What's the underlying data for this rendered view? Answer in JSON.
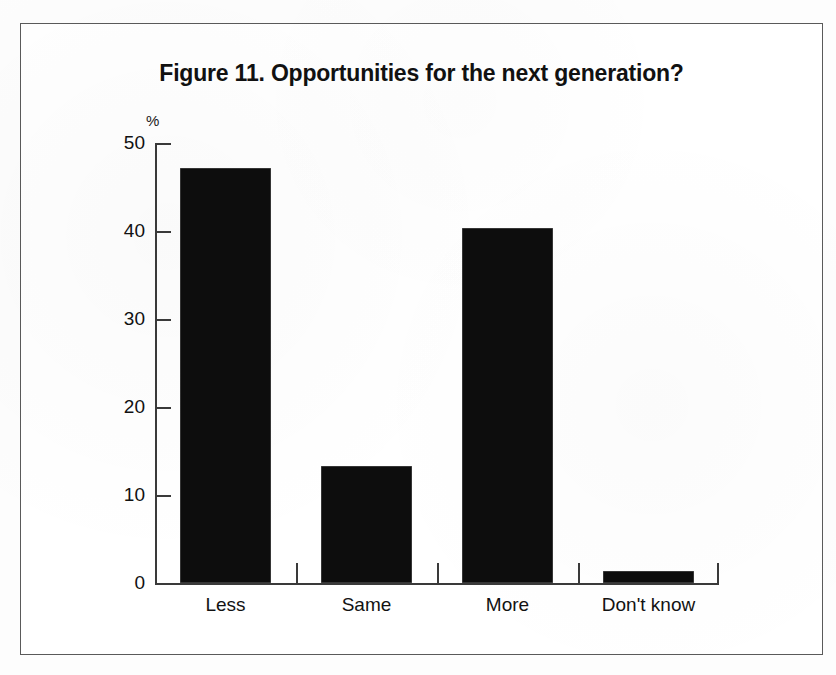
{
  "figure": {
    "title": "Figure 11. Opportunities for the next generation?",
    "y_unit": "%"
  },
  "axis": {
    "y_ticks": [
      "0",
      "10",
      "20",
      "30",
      "40",
      "50"
    ],
    "x_categories": [
      "Less",
      "Same",
      "More",
      "Don't know"
    ]
  },
  "chart_data": {
    "type": "bar",
    "title": "Figure 11. Opportunities for the next generation?",
    "xlabel": "",
    "ylabel": "%",
    "categories": [
      "Less",
      "Same",
      "More",
      "Don't know"
    ],
    "values": [
      47.2,
      13.3,
      40.3,
      1.4
    ],
    "ylim": [
      0,
      50
    ],
    "yticks": [
      0,
      10,
      20,
      30,
      40,
      50
    ],
    "grid": false,
    "legend": false,
    "bar_color": "#0d0d0d",
    "background_color": "#ffffff"
  }
}
